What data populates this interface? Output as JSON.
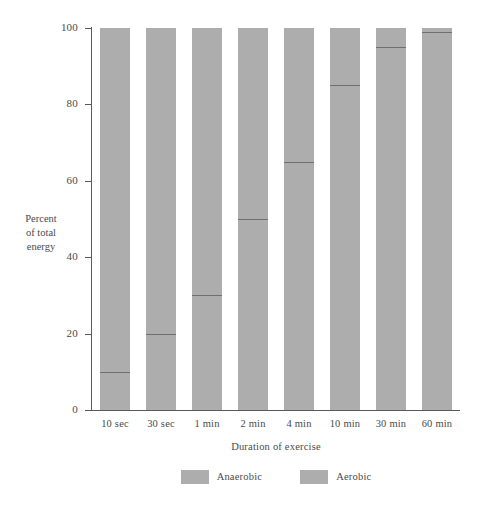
{
  "chart_data": {
    "type": "bar",
    "title": "",
    "subtitle": "",
    "xlabel": "Duration of exercise",
    "ylabel": "Percent of total energy",
    "ylabel_lines": [
      "Percent",
      "of total",
      "energy"
    ],
    "categories": [
      "10 sec",
      "30 sec",
      "1 min",
      "2 min",
      "4 min",
      "10 min",
      "30 min",
      "60 min"
    ],
    "series": [
      {
        "name": "Anaerobic",
        "values": [
          10,
          20,
          30,
          50,
          65,
          85,
          95,
          99
        ]
      },
      {
        "name": "Aerobic",
        "values": [
          90,
          80,
          70,
          50,
          35,
          15,
          5,
          1
        ]
      }
    ],
    "ylim": [
      0,
      100
    ],
    "yticks": [
      0,
      20,
      40,
      60,
      80,
      100
    ],
    "ytick_labels": [
      "0",
      "20",
      "40",
      "60",
      "80",
      "100"
    ],
    "stacked": true,
    "grid": false,
    "legend_position": "bottom",
    "bar_color": "#adadad",
    "divider_color": "#6f6f6f",
    "axis_color": "#5a5a5a"
  },
  "legend": {
    "entries": [
      {
        "label": "Anaerobic",
        "color": "#adadad"
      },
      {
        "label": "Aerobic",
        "color": "#adadad"
      }
    ]
  }
}
